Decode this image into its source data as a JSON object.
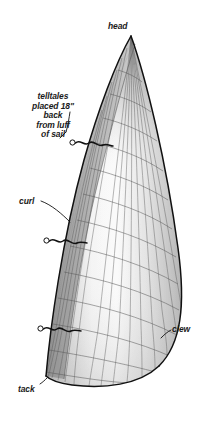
{
  "diagram": {
    "subject": "sail",
    "background_color": "#ffffff",
    "line_color": "#3a3a3a",
    "outline_color": "#1a1a1a",
    "fill_light": "#f2f2f2",
    "fill_mid": "#c9c9c9",
    "fill_dark": "#9a9a9a"
  },
  "labels": {
    "head": "head",
    "curl": "curl",
    "clew": "clew",
    "tack": "tack",
    "telltales": "telltales\nplaced 18\"\nback\nfrom luff\nof sail"
  },
  "annotations": [
    {
      "name": "head",
      "text": "head",
      "position": "top-center"
    },
    {
      "name": "telltales",
      "text": "telltales placed 18\" back from luff of sail",
      "position": "upper-left"
    },
    {
      "name": "curl",
      "text": "curl",
      "position": "mid-left"
    },
    {
      "name": "clew",
      "text": "clew",
      "position": "lower-right"
    },
    {
      "name": "tack",
      "text": "tack",
      "position": "bottom-left"
    }
  ],
  "telltale_markers": [
    {
      "name": "telltale-upper",
      "x": 72,
      "y": 142
    },
    {
      "name": "telltale-middle",
      "x": 46,
      "y": 240
    },
    {
      "name": "telltale-lower",
      "x": 40,
      "y": 328
    }
  ],
  "sail_parts": {
    "head": "head",
    "luff": "luff",
    "leech": "leech",
    "foot": "foot",
    "tack": "tack",
    "clew": "clew",
    "curl": "curl"
  }
}
